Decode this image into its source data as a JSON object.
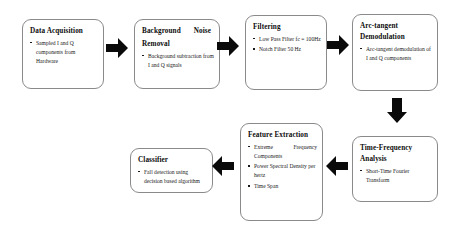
{
  "diagram": {
    "background_color": "#ffffff",
    "box_border_color": "#8a8a8a",
    "arrow_color": "#0a0a0a",
    "text_color": "#0d0d0d"
  },
  "nodes": [
    {
      "id": "data-acquisition",
      "title": "Data Acquisition",
      "bullets": [
        "Sampled I and Q components from Hardware"
      ]
    },
    {
      "id": "background-noise-removal",
      "title": "Background          Noise Removal",
      "title_line1": "Background",
      "title_line2": "Noise",
      "title_line3": "Removal",
      "bullets": [
        "Background subtraction from I and Q signals"
      ]
    },
    {
      "id": "filtering",
      "title": "Filtering",
      "bullets": [
        "Low Pass Filter fc = 100Hz",
        "Notch Filter 50 Hz"
      ]
    },
    {
      "id": "arc-tangent-demodulation",
      "title": "Arc-tangent Demodulation",
      "bullets": [
        "Arc-tangent demodulation of I and Q components"
      ]
    },
    {
      "id": "time-frequency-analysis",
      "title": "Time-Frequency Analysis",
      "bullets": [
        "Short-Time Fourier Transform"
      ]
    },
    {
      "id": "feature-extraction",
      "title": "Feature Extraction",
      "bullets": [
        "Extreme          Frequency Components",
        "Power Spectral Density per hertz",
        "Time Span"
      ]
    },
    {
      "id": "classifier",
      "title": "Classifier",
      "bullets": [
        "Fall detection using decision based algorithm"
      ]
    }
  ],
  "arrows": [
    {
      "id": "arrow-1",
      "direction": "right",
      "from": "data-acquisition",
      "to": "background-noise-removal"
    },
    {
      "id": "arrow-2",
      "direction": "right",
      "from": "background-noise-removal",
      "to": "filtering"
    },
    {
      "id": "arrow-3",
      "direction": "right",
      "from": "filtering",
      "to": "arc-tangent-demodulation"
    },
    {
      "id": "arrow-4",
      "direction": "down",
      "from": "arc-tangent-demodulation",
      "to": "time-frequency-analysis"
    },
    {
      "id": "arrow-5",
      "direction": "left",
      "from": "time-frequency-analysis",
      "to": "feature-extraction"
    },
    {
      "id": "arrow-6",
      "direction": "left",
      "from": "feature-extraction",
      "to": "classifier"
    }
  ]
}
